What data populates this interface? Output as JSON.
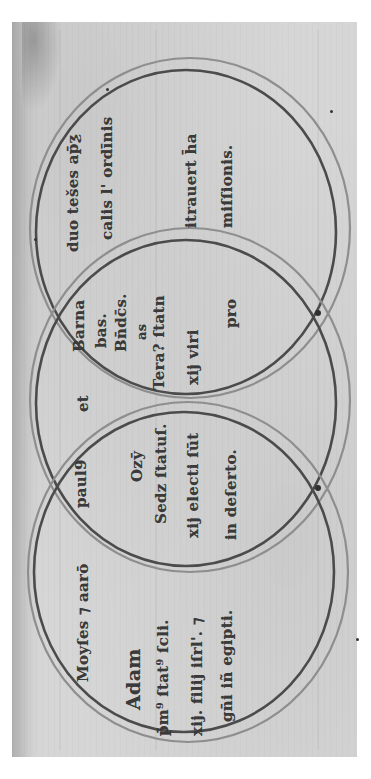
{
  "document": {
    "type": "medieval manuscript leaf (rotated 90°)",
    "colors": {
      "parchment": "#d4d4d4",
      "ink": "#3a3a3a",
      "circle_inner": "#4a4a4a",
      "circle_outer": "#8a8a8a"
    }
  },
  "circles": {
    "top": {
      "label_line1": "duo tešes ap̄ƺ",
      "label_line2": "calis l' ordīnis",
      "body_line1": "itrauert h̄a",
      "body_line2": "miſſionis."
    },
    "middle_overlap_upper": {
      "line1": "Barna",
      "line2": "bas.",
      "line3": "Bn̄dc̄s.",
      "line4": "as",
      "line5": "Tera? ſtatn",
      "line6": "xij viri",
      "line7": "pro"
    },
    "middle": {
      "connector": "et"
    },
    "middle_overlap_lower": {
      "line1": "paul9",
      "line2": "Ozȳ",
      "line3": "Sedz ſtatuſ.",
      "line4": "xij electi ſūt",
      "line5": "in deſerto."
    },
    "bottom": {
      "heading": "Moyſes ⁊ aarō",
      "line1": "Adam",
      "line2": "p̄m⁹ ſtat⁹ ſcli.",
      "line3": "xij. filij iſrl'. ⁊",
      "line4": "gn̄i iñ egipti."
    }
  }
}
